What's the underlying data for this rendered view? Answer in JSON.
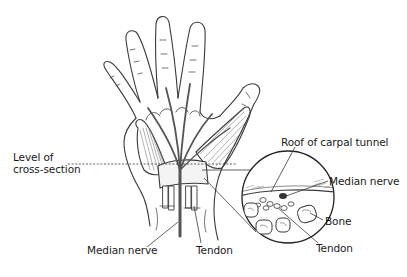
{
  "figure": {
    "colors": {
      "outline": "#3a3a3a",
      "nerve": "#555555",
      "background": "#ffffff",
      "label_text": "#1a1a1a"
    }
  },
  "labels": {
    "level_of_cross_section_line1": "Level of",
    "level_of_cross_section_line2": "cross-section",
    "roof_of_carpal_tunnel": "Roof of carpal tunnel",
    "median_nerve_inset": "Median nerve",
    "bone": "Bone",
    "tendon_inset": "Tendon",
    "median_nerve_hand": "Median nerve",
    "tendon_hand": "Tendon"
  }
}
